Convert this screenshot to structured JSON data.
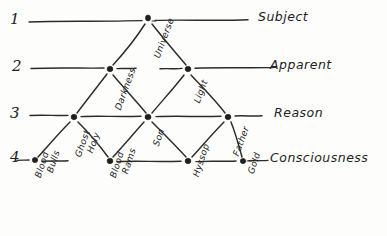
{
  "page": {
    "background_color": "#fdfdfb",
    "ink_color": "#2b2b2b"
  },
  "levels": [
    {
      "number": "1",
      "label": "Subject"
    },
    {
      "number": "2",
      "label": "Apparent"
    },
    {
      "number": "3",
      "label": "Reason"
    },
    {
      "number": "4",
      "label": "Consciousness"
    }
  ],
  "nodes": [
    {
      "id": "universe",
      "label": "Universe",
      "level": 1
    },
    {
      "id": "darkness",
      "label": "Darkness",
      "level": 2
    },
    {
      "id": "light",
      "label": "Light",
      "level": 2
    },
    {
      "id": "holy-ghost",
      "label": "Holy Ghost",
      "level": 3
    },
    {
      "id": "son",
      "label": "Son",
      "level": 3
    },
    {
      "id": "father",
      "label": "Father",
      "level": 3
    },
    {
      "id": "bulls-blood",
      "label": "Bulls Blood",
      "level": 4
    },
    {
      "id": "rams-blood",
      "label": "Rams Blood",
      "level": 4
    },
    {
      "id": "hyssop",
      "label": "Hyssop",
      "level": 4
    },
    {
      "id": "gold",
      "label": "Gold",
      "level": 4
    }
  ],
  "node_label_parts": {
    "holy_ghost_line1": "Holy",
    "holy_ghost_line2": "Ghost",
    "bulls_blood_line1": "Bulls",
    "bulls_blood_line2": "Blood",
    "rams_blood_line1": "Rams",
    "rams_blood_line2": "Blood"
  },
  "edges": [
    {
      "from": "universe",
      "to": "darkness"
    },
    {
      "from": "universe",
      "to": "light"
    },
    {
      "from": "darkness",
      "to": "holy-ghost"
    },
    {
      "from": "darkness",
      "to": "son"
    },
    {
      "from": "light",
      "to": "son"
    },
    {
      "from": "light",
      "to": "father"
    },
    {
      "from": "holy-ghost",
      "to": "bulls-blood"
    },
    {
      "from": "holy-ghost",
      "to": "rams-blood"
    },
    {
      "from": "son",
      "to": "rams-blood"
    },
    {
      "from": "son",
      "to": "hyssop"
    },
    {
      "from": "father",
      "to": "hyssop"
    },
    {
      "from": "father",
      "to": "gold"
    }
  ]
}
